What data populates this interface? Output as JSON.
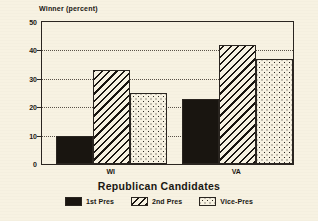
{
  "chart_data": {
    "type": "bar",
    "title": "",
    "ylabel": "Winner (percent)",
    "xlabel": "Republican Candidates",
    "categories": [
      "WI",
      "VA"
    ],
    "series": [
      {
        "name": "1st Pres",
        "values": [
          10,
          23
        ],
        "pattern": "solid",
        "color": "#191510"
      },
      {
        "name": "2nd Pres",
        "values": [
          33,
          42
        ],
        "pattern": "diagonal-hatch",
        "color": "#191510"
      },
      {
        "name": "Vice-Pres",
        "values": [
          25,
          37
        ],
        "pattern": "dotted",
        "color": "#2a2520"
      }
    ],
    "ylim": [
      0,
      50
    ],
    "yticks": [
      0,
      10,
      20,
      30,
      40,
      50
    ],
    "ytick_labels": [
      "0",
      "10",
      "20",
      "30",
      "40",
      "50"
    ],
    "grid": true,
    "grid_axis": "y",
    "grid_style": "dotted",
    "legend_position": "bottom-center",
    "background_color": "#f7f2e2",
    "axis_color": "#2a2520"
  },
  "figure": {
    "ylabel": "Winner (percent)",
    "xlabel": "Republican Candidates"
  }
}
